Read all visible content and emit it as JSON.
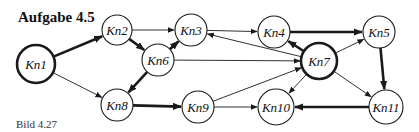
{
  "title": "Aufgabe 4.5",
  "caption": "Bild 4.27",
  "colors": {
    "stroke": "#1a1a1a",
    "background": "#ffffff"
  },
  "nodes": [
    {
      "id": "Kn1",
      "label": "Kn1",
      "x": 36,
      "y": 64,
      "r": 19,
      "bold": true
    },
    {
      "id": "Kn2",
      "label": "Kn2",
      "x": 117,
      "y": 30,
      "r": 15,
      "bold": false
    },
    {
      "id": "Kn3",
      "label": "Kn3",
      "x": 191,
      "y": 30,
      "r": 16,
      "bold": false
    },
    {
      "id": "Kn4",
      "label": "Kn4",
      "x": 274,
      "y": 32,
      "r": 16,
      "bold": false
    },
    {
      "id": "Kn5",
      "label": "Kn5",
      "x": 379,
      "y": 32,
      "r": 16,
      "bold": false
    },
    {
      "id": "Kn6",
      "label": "Kn6",
      "x": 158,
      "y": 60,
      "r": 16,
      "bold": false
    },
    {
      "id": "Kn7",
      "label": "Kn7",
      "x": 319,
      "y": 61,
      "r": 18,
      "bold": true
    },
    {
      "id": "Kn8",
      "label": "Kn8",
      "x": 117,
      "y": 105,
      "r": 16,
      "bold": false
    },
    {
      "id": "Kn9",
      "label": "Kn9",
      "x": 198,
      "y": 107,
      "r": 16,
      "bold": false
    },
    {
      "id": "Kn10",
      "label": "Kn10",
      "x": 276,
      "y": 107,
      "r": 18,
      "bold": false
    },
    {
      "id": "Kn11",
      "label": "Kn11",
      "x": 386,
      "y": 107,
      "r": 17,
      "bold": false
    }
  ],
  "edges": [
    {
      "from": "Kn1",
      "to": "Kn2",
      "bold": true
    },
    {
      "from": "Kn1",
      "to": "Kn8",
      "bold": false
    },
    {
      "from": "Kn2",
      "to": "Kn3",
      "bold": false
    },
    {
      "from": "Kn2",
      "to": "Kn6",
      "bold": true
    },
    {
      "from": "Kn6",
      "to": "Kn3",
      "bold": true
    },
    {
      "from": "Kn6",
      "to": "Kn8",
      "bold": true
    },
    {
      "from": "Kn6",
      "to": "Kn7",
      "bold": false
    },
    {
      "from": "Kn3",
      "to": "Kn4",
      "bold": false
    },
    {
      "from": "Kn7",
      "to": "Kn3",
      "bold": false
    },
    {
      "from": "Kn7",
      "to": "Kn4",
      "bold": true
    },
    {
      "from": "Kn4",
      "to": "Kn5",
      "bold": true
    },
    {
      "from": "Kn7",
      "to": "Kn5",
      "bold": false
    },
    {
      "from": "Kn5",
      "to": "Kn11",
      "bold": true
    },
    {
      "from": "Kn7",
      "to": "Kn11",
      "bold": false
    },
    {
      "from": "Kn7",
      "to": "Kn10",
      "bold": false
    },
    {
      "from": "Kn8",
      "to": "Kn9",
      "bold": true
    },
    {
      "from": "Kn9",
      "to": "Kn7",
      "bold": false
    },
    {
      "from": "Kn9",
      "to": "Kn10",
      "bold": false
    },
    {
      "from": "Kn11",
      "to": "Kn10",
      "bold": true
    }
  ]
}
